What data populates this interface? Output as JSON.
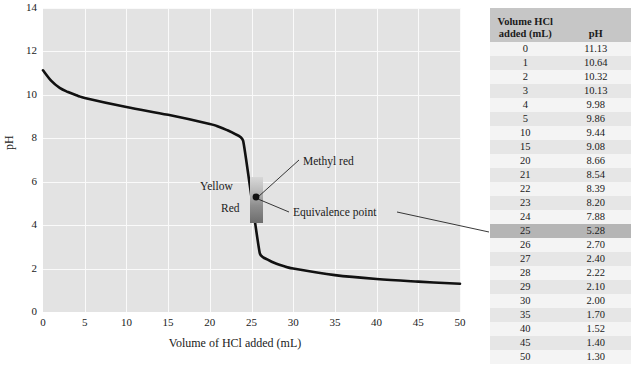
{
  "chart_data": {
    "type": "line",
    "title": "",
    "xlabel": "Volume of HCl added (mL)",
    "ylabel": "pH",
    "xlim": [
      0,
      50
    ],
    "ylim": [
      0,
      14
    ],
    "xticks": [
      0,
      5,
      10,
      15,
      20,
      25,
      30,
      35,
      40,
      45,
      50
    ],
    "yticks": [
      0,
      2,
      4,
      6,
      8,
      10,
      12,
      14
    ],
    "grid": true,
    "legend": "none",
    "series": [
      {
        "name": "Titration of weak base with HCl",
        "x": [
          0,
          1,
          2,
          3,
          4,
          5,
          10,
          15,
          20,
          21,
          22,
          23,
          24,
          25,
          26,
          27,
          28,
          29,
          30,
          35,
          40,
          45,
          50
        ],
        "y": [
          11.13,
          10.64,
          10.32,
          10.13,
          9.98,
          9.86,
          9.44,
          9.08,
          8.66,
          8.54,
          8.39,
          8.2,
          7.88,
          5.28,
          2.7,
          2.4,
          2.22,
          2.1,
          2.0,
          1.7,
          1.52,
          1.4,
          1.3
        ]
      }
    ],
    "annotations": [
      {
        "name": "methyl-red",
        "label": "Methyl red",
        "x": 25,
        "y": 6.6
      },
      {
        "name": "equivalence-point",
        "label": "Equivalence point",
        "x": 25,
        "y": 5.28
      },
      {
        "name": "indicator-yellow",
        "label": "Yellow",
        "x": 22.5,
        "y": 6.0
      },
      {
        "name": "indicator-red",
        "label": "Red",
        "x": 23.2,
        "y": 4.9
      }
    ],
    "marker_point": {
      "x": 25,
      "y": 5.28
    }
  },
  "chart": {
    "y_axis": {
      "title": "pH",
      "ticks": [
        "0",
        "2",
        "4",
        "6",
        "8",
        "10",
        "12",
        "14"
      ]
    },
    "x_axis": {
      "title": "Volume of HCl added (mL)",
      "ticks": [
        "0",
        "5",
        "10",
        "15",
        "20",
        "25",
        "30",
        "35",
        "40",
        "45",
        "50"
      ]
    },
    "annotations": {
      "methyl_red": "Methyl red",
      "equivalence_point": "Equivalence point",
      "yellow": "Yellow",
      "red": "Red"
    },
    "colors": {
      "plot_background": "#e3e3e3",
      "gridline": "#fafafa",
      "curve": "#111111",
      "band_top": "#d8d8d8",
      "band_bottom": "#6d6d6d"
    }
  },
  "table": {
    "headers": {
      "volume": "Volume HCl added (mL)",
      "volume_line1": "Volume HCl",
      "volume_line2": "added (mL)",
      "ph": "pH"
    },
    "highlight_row_index": 13,
    "rows": [
      {
        "volume": "0",
        "ph": "11.13"
      },
      {
        "volume": "1",
        "ph": "10.64"
      },
      {
        "volume": "2",
        "ph": "10.32"
      },
      {
        "volume": "3",
        "ph": "10.13"
      },
      {
        "volume": "4",
        "ph": "9.98"
      },
      {
        "volume": "5",
        "ph": "9.86"
      },
      {
        "volume": "10",
        "ph": "9.44"
      },
      {
        "volume": "15",
        "ph": "9.08"
      },
      {
        "volume": "20",
        "ph": "8.66"
      },
      {
        "volume": "21",
        "ph": "8.54"
      },
      {
        "volume": "22",
        "ph": "8.39"
      },
      {
        "volume": "23",
        "ph": "8.20"
      },
      {
        "volume": "24",
        "ph": "7.88"
      },
      {
        "volume": "25",
        "ph": "5.28"
      },
      {
        "volume": "26",
        "ph": "2.70"
      },
      {
        "volume": "27",
        "ph": "2.40"
      },
      {
        "volume": "28",
        "ph": "2.22"
      },
      {
        "volume": "29",
        "ph": "2.10"
      },
      {
        "volume": "30",
        "ph": "2.00"
      },
      {
        "volume": "35",
        "ph": "1.70"
      },
      {
        "volume": "40",
        "ph": "1.52"
      },
      {
        "volume": "45",
        "ph": "1.40"
      },
      {
        "volume": "50",
        "ph": "1.30"
      }
    ]
  }
}
